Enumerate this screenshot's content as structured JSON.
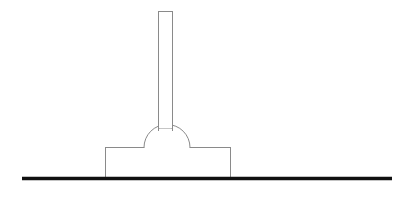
{
  "canvas": {
    "width": 415,
    "height": 203,
    "background_color": "#ffffff",
    "title": "Line drawing of a post mounted on a domed pedestal resting on a ground line"
  },
  "style": {
    "outline_color": "#8a8a8a",
    "outline_width": 1,
    "fill_color": "#ffffff",
    "ground_color": "#111111",
    "ground_width": 3.4
  },
  "diagram": {
    "type": "line-drawing",
    "parts": [
      {
        "name": "ground-line",
        "label": "Ground line",
        "shape": "line",
        "x1": 22,
        "y1": 178.5,
        "x2": 392,
        "y2": 178.5,
        "stroke": "#111111",
        "stroke_width": 3.4
      },
      {
        "name": "base-block",
        "label": "Rectangular base block",
        "shape": "rect",
        "x": 105.5,
        "y": 147.5,
        "width": 125,
        "height": 31,
        "stroke": "#8a8a8a",
        "fill": "#ffffff"
      },
      {
        "name": "dome",
        "label": "Semicircular dome",
        "shape": "semicircle",
        "center_x": 167,
        "center_y": 147.5,
        "radius": 23,
        "stroke": "#8a8a8a",
        "fill": "#ffffff"
      },
      {
        "name": "vertical-rod",
        "label": "Vertical rod / post",
        "shape": "rect",
        "x": 158.5,
        "y": 11.5,
        "width": 14,
        "height": 117,
        "stroke": "#8a8a8a",
        "fill": "#ffffff"
      }
    ]
  }
}
